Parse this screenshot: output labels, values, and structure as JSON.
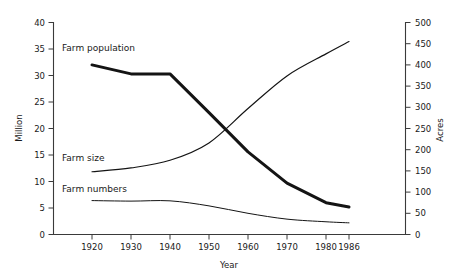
{
  "chart_data": {
    "type": "line",
    "title": "",
    "xlabel": "Year",
    "ylabel": "Million",
    "y2label": "Acres",
    "grid": false,
    "legend_position": "inline-annotations",
    "x": [
      1920,
      1930,
      1940,
      1950,
      1960,
      1970,
      1980,
      1986
    ],
    "categories": [
      "1920",
      "1930",
      "1940",
      "1950",
      "1960",
      "1970",
      "1980",
      "1986"
    ],
    "xlim": [
      1920,
      1986
    ],
    "ylim": [
      0,
      40
    ],
    "y2lim": [
      0,
      500
    ],
    "yticks": [
      0,
      5,
      10,
      15,
      20,
      25,
      30,
      35,
      40
    ],
    "ytick_labels": [
      "0",
      "5",
      "10",
      "15",
      "20",
      "25",
      "30",
      "35",
      "40"
    ],
    "y2ticks": [
      0,
      50,
      100,
      150,
      200,
      250,
      300,
      350,
      400,
      450,
      500
    ],
    "y2tick_labels": [
      "0",
      "50",
      "100",
      "150",
      "200",
      "250",
      "300",
      "350",
      "400",
      "450",
      "500"
    ],
    "xticks": [
      1920,
      1930,
      1940,
      1950,
      1960,
      1970,
      1980,
      1986
    ],
    "series": [
      {
        "name": "Farm population",
        "axis": "left",
        "unit": "Million",
        "values": [
          32.0,
          30.3,
          30.3,
          23.0,
          15.6,
          9.7,
          6.0,
          5.2
        ],
        "style": "thick"
      },
      {
        "name": "Farm size",
        "axis": "right",
        "unit": "Acres",
        "values": [
          148,
          157,
          175,
          216,
          297,
          374,
          426,
          455
        ],
        "style": "thin"
      },
      {
        "name": "Farm numbers",
        "axis": "left",
        "unit": "Million",
        "values": [
          6.4,
          6.3,
          6.35,
          5.4,
          4.0,
          2.9,
          2.4,
          2.2
        ],
        "style": "thin"
      }
    ],
    "annotations": [
      {
        "text": "Farm population",
        "x": 1920,
        "y": 35.2
      },
      {
        "text": "Farm size",
        "x": 1920,
        "y": 14.6
      },
      {
        "text": "Farm numbers",
        "x": 1920,
        "y": 9.2
      }
    ]
  },
  "axes": {
    "left_title": "Million",
    "right_title": "Acres",
    "bottom_title": "Year"
  },
  "labels": {
    "farm_population": "Farm population",
    "farm_size": "Farm size",
    "farm_numbers": "Farm numbers"
  },
  "colors": {
    "line": "#141414",
    "axis": "#3a3a3a",
    "text": "#1a1a1a",
    "background": "#ffffff"
  }
}
